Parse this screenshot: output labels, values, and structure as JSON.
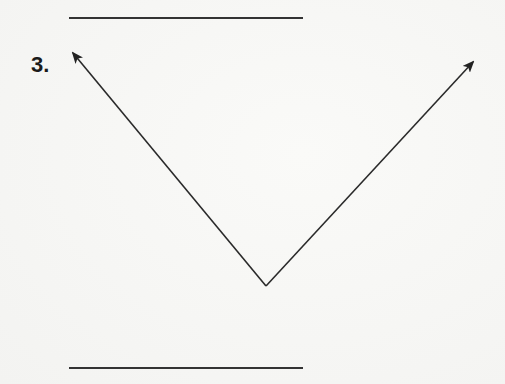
{
  "problem": {
    "number_label": "3."
  },
  "figure": {
    "stroke_color": "#2a2a2a",
    "top_line": {
      "x1": 69,
      "y1": 18,
      "x2": 303,
      "y2": 18
    },
    "bottom_line": {
      "x1": 69,
      "y1": 368,
      "x2": 303,
      "y2": 368
    },
    "vertex": {
      "x": 266,
      "y": 286
    },
    "ray_left_end": {
      "x": 73,
      "y": 53
    },
    "ray_right_end": {
      "x": 473,
      "y": 62
    }
  }
}
